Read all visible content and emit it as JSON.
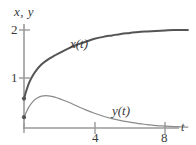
{
  "chart_data": {
    "type": "line",
    "title": "",
    "subtitle": "",
    "axis_corner_label": "x, y",
    "xlabel": "t",
    "ylabel": "x, y",
    "xlim": [
      0,
      9.5
    ],
    "ylim": [
      0,
      2.2
    ],
    "xticks": [
      4,
      8
    ],
    "xtick_labels": [
      "4",
      "8"
    ],
    "yticks": [
      1,
      2
    ],
    "ytick_labels": [
      "1",
      "2"
    ],
    "grid": false,
    "legend_position": "inline-annotations",
    "annotations": [
      {
        "text": "x(t)",
        "x": 2.6,
        "y": 1.85
      },
      {
        "text": "y(t)",
        "x": 5.2,
        "y": 0.45
      }
    ],
    "series": [
      {
        "name": "x(t)",
        "label": "x(t)",
        "color": "#555555",
        "linewidth": 2.0,
        "initial_point": {
          "x": 0,
          "y": 0.6
        },
        "x": [
          0,
          0.15,
          0.3,
          0.5,
          0.75,
          1.0,
          1.25,
          1.5,
          1.75,
          2.0,
          2.5,
          3.0,
          3.5,
          4.0,
          4.5,
          5.0,
          5.5,
          6.0,
          6.5,
          7.0,
          7.5,
          8.0,
          8.5,
          9.0,
          9.3
        ],
        "values": [
          0.6,
          0.78,
          0.93,
          1.07,
          1.2,
          1.3,
          1.37,
          1.43,
          1.48,
          1.53,
          1.62,
          1.7,
          1.76,
          1.82,
          1.86,
          1.89,
          1.92,
          1.94,
          1.96,
          1.97,
          1.98,
          1.99,
          2.0,
          2.0,
          2.0
        ]
      },
      {
        "name": "y(t)",
        "label": "y(t)",
        "color": "#8a8a8a",
        "linewidth": 1.2,
        "initial_point": {
          "x": 0,
          "y": 0.22
        },
        "x": [
          0,
          0.25,
          0.5,
          0.75,
          1.0,
          1.25,
          1.5,
          1.75,
          2.0,
          2.5,
          3.0,
          3.5,
          4.0,
          4.5,
          5.0,
          5.5,
          6.0,
          6.5,
          7.0,
          7.5,
          8.0,
          8.5,
          9.0,
          9.3
        ],
        "values": [
          0.22,
          0.41,
          0.54,
          0.61,
          0.65,
          0.66,
          0.65,
          0.63,
          0.6,
          0.53,
          0.45,
          0.37,
          0.3,
          0.24,
          0.19,
          0.15,
          0.12,
          0.09,
          0.07,
          0.05,
          0.04,
          0.03,
          0.02,
          0.02
        ]
      }
    ],
    "markers": [
      {
        "series": "x(t)",
        "x": 0,
        "y": 0.6,
        "color": "#555555"
      },
      {
        "series": "y(t)",
        "x": 0,
        "y": 0.22,
        "color": "#555555"
      }
    ],
    "axis_color": "#999999",
    "text_color": "#3a3a3a",
    "background": "#ffffff"
  }
}
